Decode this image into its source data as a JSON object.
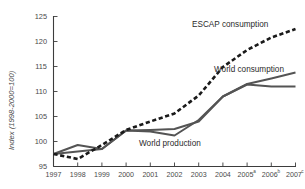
{
  "chart_data": {
    "type": "line",
    "title": "",
    "subtitle": "",
    "xlabel": "",
    "ylabel": "Index (1998-2000=100)",
    "xlim": [
      1997,
      2007
    ],
    "ylim": [
      95,
      125
    ],
    "ytick_step": 5,
    "grid": false,
    "legend": "inline-annotations",
    "x": [
      1997,
      1998,
      1999,
      2000,
      2001,
      2002,
      2003,
      2004,
      2005,
      2006,
      2007
    ],
    "xtick_labels": [
      "1997",
      "1998",
      "1999",
      "2000",
      "2001",
      "2002",
      "2003",
      "2004",
      "2005",
      "2006",
      "2007"
    ],
    "xtick_superscripts": [
      "",
      "",
      "",
      "",
      "",
      "",
      "",
      "",
      "a",
      "b",
      "c"
    ],
    "ytick_labels": [
      "95",
      "100",
      "105",
      "110",
      "115",
      "120",
      "125"
    ],
    "ytick_values": [
      95,
      100,
      105,
      110,
      115,
      120,
      125
    ],
    "series": [
      {
        "name": "ESCAP consumption",
        "style": "dashed",
        "color": "#1a1a1a",
        "values": [
          97.5,
          96.5,
          99.3,
          102.3,
          104.0,
          105.6,
          109.2,
          114.9,
          118.3,
          120.8,
          122.5
        ]
      },
      {
        "name": "World consumption",
        "style": "solid",
        "color": "#545454",
        "values": [
          97.5,
          99.3,
          98.5,
          102.2,
          102.3,
          102.5,
          104.0,
          109.0,
          111.5,
          112.6,
          113.8
        ]
      },
      {
        "name": "World production",
        "style": "solid",
        "color": "#545454",
        "values": [
          97.5,
          98.0,
          98.5,
          102.2,
          102.0,
          101.2,
          104.3,
          109.0,
          111.4,
          111.0,
          111.0
        ]
      }
    ],
    "annotations": [
      {
        "text": "ESCAP consumption",
        "series": "ESCAP consumption",
        "x_px": 192,
        "y_px": 27
      },
      {
        "text": "World consumption",
        "series": "World consumption",
        "x_px": 214,
        "y_px": 72
      },
      {
        "text": "World production",
        "series": "World production",
        "x_px": 139,
        "y_px": 146
      }
    ]
  }
}
